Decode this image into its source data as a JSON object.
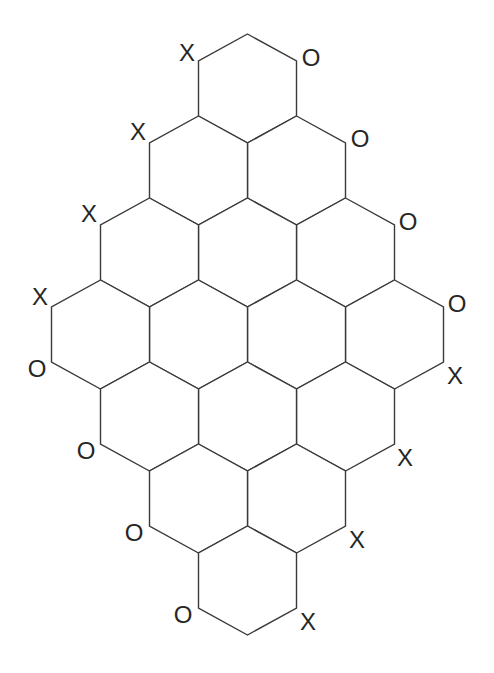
{
  "diagram": {
    "type": "hex-board",
    "board_size": [
      4,
      4
    ],
    "colors": {
      "line": "#3a3a3a",
      "text": "#262626",
      "background": "#ffffff"
    },
    "geometry": {
      "half_width": 49,
      "vertical_half_edge": 27.5,
      "slant_rise": 27,
      "origin_x": 247.5,
      "origin_y": 88.5,
      "row_pitch": 82
    },
    "labels": [
      {
        "text": "X",
        "x": 187,
        "y": 52
      },
      {
        "text": "X",
        "x": 138,
        "y": 131
      },
      {
        "text": "X",
        "x": 89,
        "y": 213
      },
      {
        "text": "X",
        "x": 40,
        "y": 296
      },
      {
        "text": "O",
        "x": 37,
        "y": 368
      },
      {
        "text": "O",
        "x": 86,
        "y": 450
      },
      {
        "text": "O",
        "x": 134,
        "y": 532
      },
      {
        "text": "O",
        "x": 183,
        "y": 614
      },
      {
        "text": "O",
        "x": 311,
        "y": 57
      },
      {
        "text": "O",
        "x": 360,
        "y": 138
      },
      {
        "text": "O",
        "x": 408,
        "y": 221
      },
      {
        "text": "O",
        "x": 457,
        "y": 303
      },
      {
        "text": "X",
        "x": 455,
        "y": 375
      },
      {
        "text": "X",
        "x": 405,
        "y": 457
      },
      {
        "text": "X",
        "x": 357,
        "y": 539
      },
      {
        "text": "X",
        "x": 308,
        "y": 621
      }
    ]
  }
}
